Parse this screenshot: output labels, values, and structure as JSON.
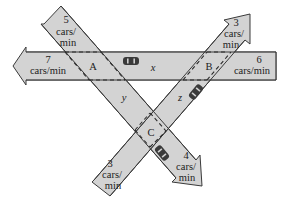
{
  "diagram": {
    "type": "traffic-network",
    "intersections": [
      {
        "id": "A",
        "label": "A"
      },
      {
        "id": "B",
        "label": "B"
      },
      {
        "id": "C",
        "label": "C"
      }
    ],
    "unknowns": [
      {
        "id": "x",
        "label": "x",
        "between": "B-A"
      },
      {
        "id": "y",
        "label": "y",
        "between": "A-C"
      },
      {
        "id": "z",
        "label": "z",
        "between": "C-B"
      }
    ],
    "flows": {
      "a_in_top": {
        "value": "5",
        "unit_line1": "cars/",
        "unit_line2": "min",
        "direction": "in"
      },
      "a_out_left": {
        "value": "7",
        "unit": "cars/min",
        "direction": "out"
      },
      "b_in_right": {
        "value": "6",
        "unit": "cars/min",
        "direction": "in"
      },
      "b_out_top": {
        "value": "3",
        "unit_line1": "cars/",
        "unit_line2": "min",
        "direction": "out"
      },
      "c_in_bottom_left": {
        "value": "3",
        "unit_line1": "cars/",
        "unit_line2": "min",
        "direction": "in"
      },
      "c_out_bottom_right": {
        "value": "4",
        "unit_line1": "cars/",
        "unit_line2": "min",
        "direction": "out"
      }
    },
    "colors": {
      "road_fill": "#d3d3d3",
      "road_stroke": "#3a3a3a",
      "car": "#3a3a3a"
    }
  }
}
